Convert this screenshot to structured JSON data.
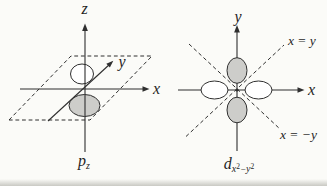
{
  "left_diagram": {
    "axis_z_label": "z",
    "axis_x_label": "x",
    "axis_y_label": "y",
    "caption_base": "p",
    "caption_sub": "z"
  },
  "right_diagram": {
    "axis_y_label": "y",
    "axis_x_label": "x",
    "diag_upper_label": "x = y",
    "diag_lower_label": "x = −y",
    "caption_base": "d",
    "caption_sub_x": "x",
    "caption_sup": "2",
    "caption_minus": "−",
    "caption_sub_y": "y"
  },
  "colors": {
    "background": "#fbfbf8",
    "line": "#2f2f2f",
    "lobe_gray": "#cdcdca",
    "lobe_white": "#ffffff",
    "text": "#1f1f1f"
  }
}
